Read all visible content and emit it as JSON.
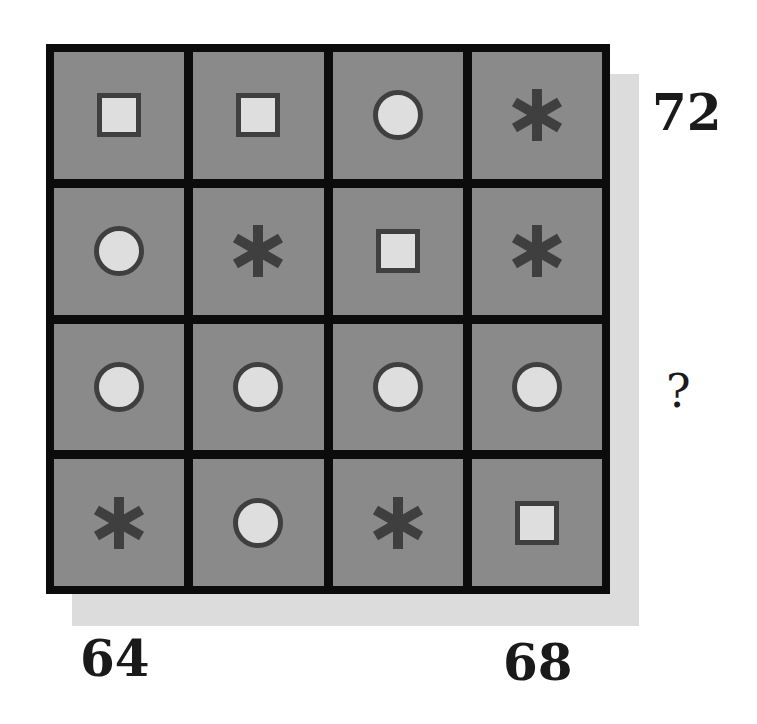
{
  "puzzle": {
    "rows": [
      [
        "square",
        "square",
        "circle",
        "star"
      ],
      [
        "circle",
        "star",
        "square",
        "star"
      ],
      [
        "circle",
        "circle",
        "circle",
        "circle"
      ],
      [
        "star",
        "circle",
        "star",
        "square"
      ]
    ],
    "row_sums": [
      "72",
      "",
      "?",
      ""
    ],
    "column_sums": [
      "64",
      "",
      "",
      "68"
    ],
    "labels": {
      "row1": "72",
      "row3": "?",
      "col1": "64",
      "col4": "68"
    }
  },
  "colors": {
    "cell_fill": "#8a8a8a",
    "grid_lines": "#0c0c0c",
    "shape_fill": "#dedede",
    "shape_outline": "#3f3f3f",
    "star": "#3f3f3f",
    "shadow": "#dcdcdc"
  }
}
